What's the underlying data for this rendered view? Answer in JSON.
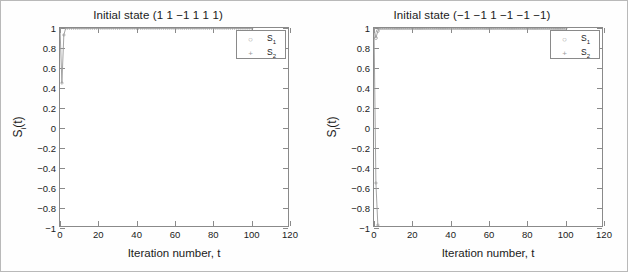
{
  "figure": {
    "panel_count": 2
  },
  "chart_data": [
    {
      "type": "line",
      "panel": "left",
      "title": "Initial state (1 1 −1 1 1 1)",
      "xlabel": "Iteration number, t",
      "ylabel": "Sᵢ(t)",
      "xlim": [
        0,
        120
      ],
      "ylim": [
        -1,
        1
      ],
      "xticks": [
        0,
        20,
        40,
        60,
        80,
        100,
        120
      ],
      "yticks": [
        1,
        0.8,
        0.6,
        0.4,
        0.2,
        0,
        -0.2,
        -0.4,
        -0.6,
        -0.8,
        -1
      ],
      "xticklabels": [
        "0",
        "20",
        "40",
        "60",
        "80",
        "100",
        "120"
      ],
      "yticklabels": [
        "1",
        "0.8",
        "0.6",
        "0.4",
        "0.2",
        "0",
        "−0.2",
        "−0.4",
        "−0.6",
        "−0.8",
        "−1"
      ],
      "grid": false,
      "legend_position": "top-right",
      "series": [
        {
          "name": "S₁",
          "marker": "circle",
          "x": [
            0,
            1,
            2,
            3,
            4,
            5,
            10,
            20,
            30,
            40,
            50,
            60,
            70,
            80,
            90,
            100
          ],
          "values": [
            -1,
            -1,
            -1,
            -1,
            -1,
            -1,
            -1,
            -1,
            -1,
            -1,
            -1,
            -1,
            -1,
            -1,
            -1,
            -1
          ]
        },
        {
          "name": "S₂",
          "marker": "plus",
          "x": [
            0,
            1,
            2,
            3,
            4,
            5,
            10,
            20,
            30,
            40,
            50,
            60,
            70,
            80,
            90,
            100
          ],
          "values": [
            1,
            0.45,
            0.93,
            1,
            1,
            1,
            1,
            1,
            1,
            1,
            1,
            1,
            1,
            1,
            1,
            1
          ]
        }
      ]
    },
    {
      "type": "line",
      "panel": "right",
      "title": "Initial state (−1 −1 1 −1 −1 −1)",
      "xlabel": "Iteration number, t",
      "ylabel": "Sᵢ(t)",
      "xlim": [
        0,
        120
      ],
      "ylim": [
        -1,
        1
      ],
      "xticks": [
        0,
        20,
        40,
        60,
        80,
        100,
        120
      ],
      "yticks": [
        1,
        0.8,
        0.6,
        0.4,
        0.2,
        0,
        -0.2,
        -0.4,
        -0.6,
        -0.8,
        -1
      ],
      "xticklabels": [
        "0",
        "20",
        "40",
        "60",
        "80",
        "100",
        "120"
      ],
      "yticklabels": [
        "1",
        "0.8",
        "0.6",
        "0.4",
        "0.2",
        "0",
        "−0.2",
        "−0.4",
        "−0.6",
        "−0.8",
        "−1"
      ],
      "grid": false,
      "legend_position": "top-right",
      "series": [
        {
          "name": "S₁",
          "marker": "circle",
          "x": [
            0,
            1,
            2,
            3,
            4,
            5,
            10,
            20,
            30,
            40,
            50,
            60,
            70,
            80,
            90,
            100
          ],
          "values": [
            1,
            0.9,
            0.97,
            1,
            1,
            1,
            1,
            1,
            1,
            1,
            1,
            1,
            1,
            1,
            1,
            1
          ]
        },
        {
          "name": "S₂",
          "marker": "plus",
          "x": [
            0,
            1,
            2,
            3,
            4,
            5,
            10,
            20,
            30,
            40,
            50,
            60,
            70,
            80,
            90,
            100
          ],
          "values": [
            1,
            -0.55,
            -0.97,
            -1,
            -1,
            -1,
            -1,
            -1,
            -1,
            -1,
            -1,
            -1,
            -1,
            -1,
            -1,
            -1
          ]
        }
      ]
    }
  ],
  "colors": {
    "axis": "#8a8a8a",
    "text": "#1b1b1b",
    "series_1": "#9a9a9a",
    "series_2": "#9a9a9a",
    "background": "#ffffff",
    "figure_border": "#b9b9b9"
  },
  "legend": {
    "entries": [
      {
        "label": "S₁",
        "marker_glyph": "○"
      },
      {
        "label": "S₂",
        "marker_glyph": "+"
      }
    ]
  }
}
